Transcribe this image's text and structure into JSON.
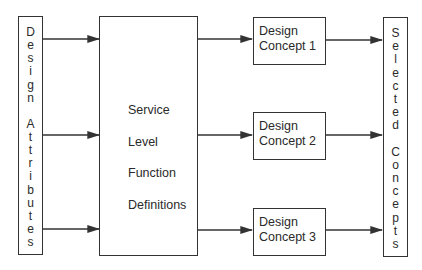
{
  "diagram": {
    "input_block": {
      "label": "Design Attributes",
      "letters": [
        "D",
        "e",
        "s",
        "i",
        "g",
        "n",
        "",
        "A",
        "t",
        "t",
        "r",
        "i",
        "b",
        "u",
        "t",
        "e",
        "s"
      ]
    },
    "center_block": {
      "lines": [
        "Service",
        "Level",
        "Function",
        "Definitions"
      ]
    },
    "concepts": [
      {
        "line1": "Design",
        "line2": "Concept 1"
      },
      {
        "line1": "Design",
        "line2": "Concept 2"
      },
      {
        "line1": "Design",
        "line2": "Concept 3"
      }
    ],
    "output_block": {
      "label": "Selected Concepts",
      "letters": [
        "S",
        "e",
        "l",
        "e",
        "c",
        "t",
        "e",
        "d",
        "",
        "C",
        "o",
        "n",
        "c",
        "e",
        "p",
        "t",
        "s"
      ]
    },
    "colors": {
      "line": "#333333",
      "text": "#2a2a2a",
      "background": "#ffffff"
    }
  }
}
